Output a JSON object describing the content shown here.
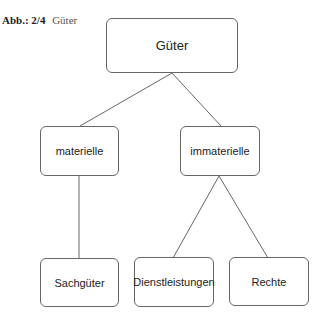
{
  "caption": {
    "number": "Abb.: 2/4",
    "title": "Güter"
  },
  "diagram": {
    "type": "tree",
    "nodes": [
      {
        "id": "gueter",
        "label": "Güter",
        "level": 0
      },
      {
        "id": "materielle",
        "label": "materielle",
        "level": 1,
        "parent": "gueter"
      },
      {
        "id": "immaterielle",
        "label": "immaterielle",
        "level": 1,
        "parent": "gueter"
      },
      {
        "id": "sachgueter",
        "label": "Sachgüter",
        "level": 2,
        "parent": "materielle"
      },
      {
        "id": "dienstleistungen",
        "label": "Dienstleistungen",
        "level": 2,
        "parent": "immaterielle"
      },
      {
        "id": "rechte",
        "label": "Rechte",
        "level": 2,
        "parent": "immaterielle"
      }
    ],
    "edges": [
      {
        "from": "gueter",
        "to": "materielle"
      },
      {
        "from": "gueter",
        "to": "immaterielle"
      },
      {
        "from": "materielle",
        "to": "sachgueter"
      },
      {
        "from": "immaterielle",
        "to": "dienstleistungen"
      },
      {
        "from": "immaterielle",
        "to": "rechte"
      }
    ],
    "colors": {
      "line": "#555555",
      "border": "#666666",
      "background": "#ffffff"
    }
  }
}
